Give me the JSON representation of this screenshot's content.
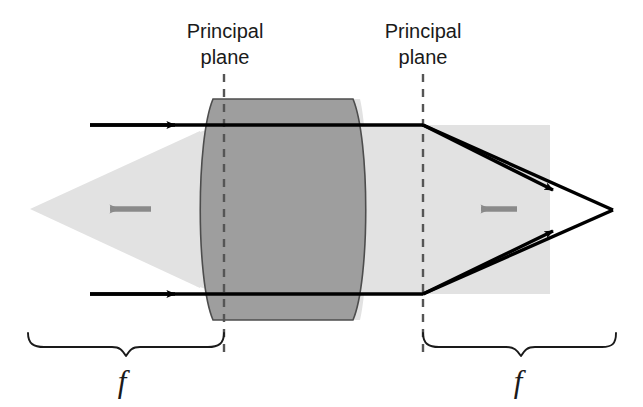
{
  "figure": {
    "width": 643,
    "height": 407,
    "background_color": "#ffffff"
  },
  "colors": {
    "background": "#ffffff",
    "lens_fill": "#9e9e9e",
    "lens_stroke": "#4d4d4d",
    "beam_fill": "#e2e2e2",
    "ray_stroke": "#000000",
    "dash_stroke": "#555555",
    "gray_arrow": "#8a8a8a",
    "brace_stroke": "#1a1a1a",
    "text": "#1a1a1a"
  },
  "labels": {
    "principal_plane_left": {
      "line1": "Principal",
      "line2": "plane",
      "x": 225,
      "y_line1": 38,
      "y_line2": 64
    },
    "principal_plane_right": {
      "line1": "Principal",
      "line2": "plane",
      "x": 423,
      "y_line1": 38,
      "y_line2": 64
    },
    "focal_left": {
      "text": "f",
      "x": 122,
      "y": 390
    },
    "focal_right": {
      "text": "f",
      "x": 518,
      "y": 390
    }
  },
  "geometry": {
    "principal_plane_left_x": 224,
    "principal_plane_right_x": 423,
    "dash_top_y": 74,
    "dash_bottom_y": 352,
    "ray_top_y": 125,
    "ray_bottom_y": 294,
    "ray_start_x": 90,
    "lens_left_x_top": 213,
    "lens_left_x_mid": 193,
    "lens_right_x_top": 353,
    "lens_right_x_mid": 364,
    "lens_top_y": 99,
    "lens_bottom_y": 320,
    "left_beam_apex_x": 30,
    "left_beam_apex_y": 209,
    "right_beam_left_x": 423,
    "right_beam_right_x": 550,
    "right_beam_top_y": 125,
    "right_beam_bottom_y": 294,
    "focus_point_x": 613,
    "focus_point_y": 210,
    "brace_left_start_x": 28,
    "brace_left_end_x": 224,
    "brace_right_start_x": 423,
    "brace_right_end_x": 616,
    "brace_y": 332
  },
  "markers": {
    "input_ray_arrowheads": 2,
    "output_ray_arrowheads": 2,
    "gray_direction_arrows": [
      {
        "name": "left-focal-direction-arrow",
        "tail_x": 150,
        "head_x": 104,
        "y": 209
      },
      {
        "name": "right-focal-direction-arrow",
        "tail_x": 516,
        "head_x": 474,
        "y": 209
      }
    ]
  },
  "icon_names": {
    "ray_arrow": "ray-arrowhead-icon",
    "gray_arrow": "left-pointing-arrow-icon",
    "brace": "curly-brace-icon",
    "dashed_line": "dashed-vertical-line-icon"
  }
}
